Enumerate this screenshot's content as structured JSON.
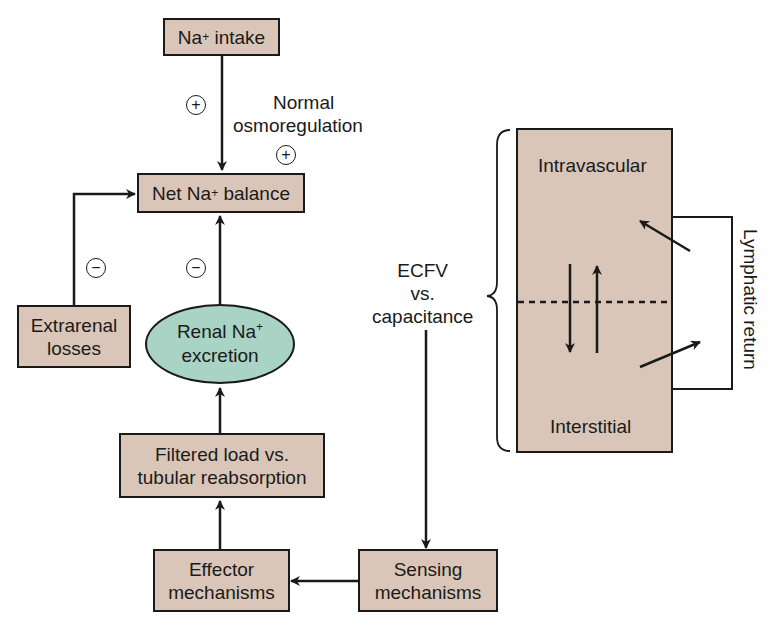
{
  "nodes": {
    "na_intake": {
      "text": "Na",
      "sup": "+",
      "text2": " intake"
    },
    "net_balance": {
      "text": "Net Na",
      "sup": "+",
      "text2": " balance"
    },
    "extrarenal": {
      "line1": "Extrarenal",
      "line2": "losses"
    },
    "renal_excretion": {
      "line1a": "Renal Na",
      "sup": "+",
      "line2": "excretion"
    },
    "filtered_load": {
      "line1": "Filtered load vs.",
      "line2": "tubular reabsorption"
    },
    "effector": {
      "line1": "Effector",
      "line2": "mechanisms"
    },
    "sensing": {
      "line1": "Sensing",
      "line2": "mechanisms"
    }
  },
  "labels": {
    "osmoregulation": {
      "line1": "Normal",
      "line2": "osmoregulation"
    },
    "ecfv": {
      "line1": "ECFV",
      "line2": "vs.",
      "line3": "capacitance"
    },
    "intravascular": "Intravascular",
    "interstitial": "Interstitial",
    "lymphatic": "Lymphatic return"
  },
  "signs": {
    "intake_plus": "+",
    "osmo_plus": "+",
    "extrarenal_minus": "−",
    "renal_minus": "−"
  },
  "colors": {
    "box_fill": "#d9c6b8",
    "ellipse_fill": "#a9d3c4",
    "stroke": "#1a1a1a"
  }
}
